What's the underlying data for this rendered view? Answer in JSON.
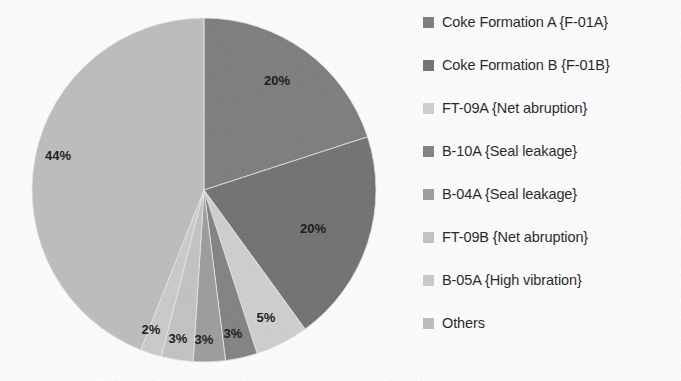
{
  "chart_data": {
    "type": "pie",
    "title": "",
    "labels": [
      "Coke Formation A {F-01A}",
      "Coke Formation B {F-01B}",
      "FT-09A {Net abruption}",
      "B-10A {Seal leakage}",
      "B-04A {Seal leakage}",
      "FT-09B {Net abruption}",
      "B-05A {High vibration}",
      "Others"
    ],
    "values": [
      20,
      20,
      5,
      3,
      3,
      3,
      2,
      44
    ],
    "value_labels": [
      "20%",
      "20%",
      "5%",
      "3%",
      "3%",
      "3%",
      "2%",
      "44%"
    ],
    "colors": [
      "#7a7a7a",
      "#6e6e6e",
      "#cfcfcf",
      "#7f7f7f",
      "#9a9a9a",
      "#c2c2c2",
      "#cacaca",
      "#bcbcbc"
    ],
    "start_angle_deg": 0,
    "direction": "clockwise",
    "legend_position": "right",
    "grid": false,
    "units": "percent"
  },
  "legend": {
    "items": [
      {
        "label": "Coke Formation A {F-01A}",
        "color": "#7a7a7a"
      },
      {
        "label": "Coke Formation B {F-01B}",
        "color": "#6e6e6e"
      },
      {
        "label": "FT-09A {Net abruption}",
        "color": "#cfcfcf"
      },
      {
        "label": "B-10A {Seal leakage}",
        "color": "#7f7f7f"
      },
      {
        "label": "B-04A {Seal leakage}",
        "color": "#9a9a9a"
      },
      {
        "label": "FT-09B {Net abruption}",
        "color": "#c2c2c2"
      },
      {
        "label": "B-05A {High vibration}",
        "color": "#cacaca"
      },
      {
        "label": "Others",
        "color": "#bcbcbc"
      }
    ]
  },
  "geometry": {
    "cx": 204,
    "cy": 190,
    "r": 172
  },
  "slice_label_positions": [
    {
      "text": "20%",
      "x": 277,
      "y": 85
    },
    {
      "text": "20%",
      "x": 313,
      "y": 233
    },
    {
      "text": "5%",
      "x": 266,
      "y": 322
    },
    {
      "text": "3%",
      "x": 233,
      "y": 338
    },
    {
      "text": "3%",
      "x": 204,
      "y": 344
    },
    {
      "text": "3%",
      "x": 178,
      "y": 343
    },
    {
      "text": "2%",
      "x": 151,
      "y": 334
    },
    {
      "text": "44%",
      "x": 58,
      "y": 160
    }
  ]
}
